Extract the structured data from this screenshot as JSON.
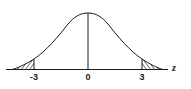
{
  "diagram": {
    "type": "normal-distribution-curve",
    "axis_label": "z",
    "tick_labels": [
      {
        "label": "-3",
        "value": -3
      },
      {
        "label": "0",
        "value": 0
      },
      {
        "label": "3",
        "value": 3
      }
    ],
    "shaded_regions": [
      {
        "side": "left",
        "from": "-inf",
        "to": -3
      },
      {
        "side": "right",
        "from": 3,
        "to": "inf"
      }
    ],
    "center_line_at": 0,
    "colors": {
      "line": "#1a1a1a",
      "background": "#ffffff"
    }
  }
}
